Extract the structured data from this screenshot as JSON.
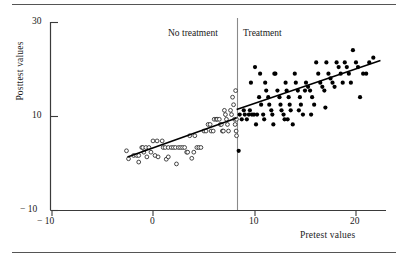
{
  "figure": {
    "kind": "scatterplot-with-regression-discontinuity",
    "rule_top": "horizontal-rule",
    "rule_bottom": "horizontal-rule"
  },
  "annotations": {
    "left_group": "No treatment",
    "right_group": "Treatment",
    "cutoff_line": "vertical-cutoff-line"
  },
  "axes": {
    "y_title": "Posttest values",
    "x_title": "Pretest values",
    "y_ticks": [
      "30",
      "10",
      "− 10"
    ],
    "x_ticks": [
      "− 10",
      "0",
      "10",
      "20"
    ]
  },
  "chart_data": {
    "type": "scatter",
    "title": "",
    "xlabel": "Pretest values",
    "ylabel": "Posttest values",
    "xlim": [
      -12,
      24
    ],
    "ylim": [
      -10,
      31
    ],
    "xticks": [
      -10,
      0,
      10,
      20
    ],
    "yticks": [
      -10,
      10,
      30
    ],
    "grid": false,
    "legend": null,
    "cutoff": {
      "x": 8.2,
      "label_left": "No treatment",
      "label_right": "Treatment"
    },
    "series": [
      {
        "name": "No treatment",
        "marker": "open-circle",
        "color": "#1a1a1a",
        "points": [
          [
            -2.6,
            2.6
          ],
          [
            -2.4,
            0.9
          ],
          [
            -1.9,
            1.6
          ],
          [
            -1.6,
            1.6
          ],
          [
            -1.4,
            1.6
          ],
          [
            -1.4,
            0.2
          ],
          [
            -1.1,
            3.3
          ],
          [
            -1.0,
            3.3
          ],
          [
            -0.7,
            3.3
          ],
          [
            -0.4,
            3.3
          ],
          [
            -0.9,
            2.3
          ],
          [
            -0.2,
            2.3
          ],
          [
            -0.6,
            1.3
          ],
          [
            0.0,
            4.7
          ],
          [
            0.2,
            1.6
          ],
          [
            0.4,
            4.7
          ],
          [
            0.5,
            1.3
          ],
          [
            0.9,
            4.7
          ],
          [
            1.0,
            3.3
          ],
          [
            1.2,
            3.3
          ],
          [
            1.3,
            0.8
          ],
          [
            1.5,
            1.3
          ],
          [
            1.5,
            3.3
          ],
          [
            1.8,
            3.3
          ],
          [
            2.0,
            3.3
          ],
          [
            2.2,
            3.3
          ],
          [
            2.3,
            -0.2
          ],
          [
            2.5,
            3.3
          ],
          [
            2.7,
            3.3
          ],
          [
            2.9,
            3.3
          ],
          [
            3.1,
            3.3
          ],
          [
            3.3,
            2.3
          ],
          [
            3.4,
            2.3
          ],
          [
            3.6,
            5.8
          ],
          [
            3.8,
            1.0
          ],
          [
            4.0,
            2.3
          ],
          [
            4.1,
            5.8
          ],
          [
            4.3,
            3.3
          ],
          [
            4.5,
            3.3
          ],
          [
            4.7,
            3.3
          ],
          [
            5.0,
            6.8
          ],
          [
            5.2,
            6.8
          ],
          [
            5.4,
            8.2
          ],
          [
            5.6,
            8.2
          ],
          [
            5.7,
            6.8
          ],
          [
            5.9,
            6.8
          ],
          [
            6.0,
            9.3
          ],
          [
            6.2,
            9.3
          ],
          [
            6.3,
            9.3
          ],
          [
            6.5,
            9.3
          ],
          [
            6.6,
            8.2
          ],
          [
            6.7,
            8.2
          ],
          [
            6.8,
            6.8
          ],
          [
            6.9,
            6.8
          ],
          [
            7.0,
            11.2
          ],
          [
            7.1,
            10.3
          ],
          [
            7.2,
            9.3
          ],
          [
            7.3,
            8.2
          ],
          [
            7.4,
            6.8
          ],
          [
            7.6,
            11.2
          ],
          [
            7.7,
            10.3
          ],
          [
            7.8,
            14.0
          ],
          [
            7.9,
            12.4
          ],
          [
            8.0,
            9.3
          ],
          [
            8.05,
            8.2
          ],
          [
            8.1,
            15.4
          ],
          [
            8.15,
            6.8
          ],
          [
            8.18,
            9.3
          ],
          [
            8.19,
            5.8
          ]
        ],
        "fit_line": {
          "x0": -2.5,
          "y0": 1.3,
          "x1": 8.2,
          "y1": 9.6
        }
      },
      {
        "name": "Treatment",
        "marker": "filled-circle",
        "color": "#000000",
        "points": [
          [
            8.4,
            2.6
          ],
          [
            8.5,
            10.3
          ],
          [
            8.7,
            9.3
          ],
          [
            8.9,
            11.2
          ],
          [
            9.0,
            10.3
          ],
          [
            9.2,
            9.3
          ],
          [
            9.4,
            10.3
          ],
          [
            9.5,
            11.2
          ],
          [
            9.7,
            10.3
          ],
          [
            9.9,
            10.3
          ],
          [
            10.0,
            20.4
          ],
          [
            10.1,
            8.2
          ],
          [
            10.2,
            10.3
          ],
          [
            10.4,
            14.0
          ],
          [
            10.6,
            12.4
          ],
          [
            10.8,
            10.3
          ],
          [
            10.9,
            9.3
          ],
          [
            11.0,
            17.1
          ],
          [
            11.1,
            15.4
          ],
          [
            11.3,
            14.0
          ],
          [
            11.4,
            12.4
          ],
          [
            11.6,
            11.2
          ],
          [
            11.7,
            10.3
          ],
          [
            11.8,
            8.2
          ],
          [
            12.0,
            19.0
          ],
          [
            12.2,
            15.4
          ],
          [
            12.4,
            14.0
          ],
          [
            12.5,
            12.4
          ],
          [
            12.6,
            11.2
          ],
          [
            12.8,
            10.3
          ],
          [
            13.0,
            17.1
          ],
          [
            13.1,
            15.4
          ],
          [
            13.3,
            14.0
          ],
          [
            13.4,
            12.4
          ],
          [
            13.5,
            11.2
          ],
          [
            13.7,
            8.2
          ],
          [
            13.9,
            19.0
          ],
          [
            14.0,
            17.1
          ],
          [
            14.2,
            15.4
          ],
          [
            14.4,
            14.0
          ],
          [
            14.5,
            12.4
          ],
          [
            14.7,
            10.3
          ],
          [
            14.9,
            15.4
          ],
          [
            15.0,
            17.1
          ],
          [
            15.2,
            16.2
          ],
          [
            15.4,
            15.4
          ],
          [
            15.6,
            14.0
          ],
          [
            15.8,
            12.4
          ],
          [
            16.0,
            21.4
          ],
          [
            16.2,
            19.0
          ],
          [
            16.4,
            17.1
          ],
          [
            16.6,
            16.2
          ],
          [
            16.8,
            15.4
          ],
          [
            17.0,
            21.4
          ],
          [
            17.2,
            19.0
          ],
          [
            17.4,
            18.0
          ],
          [
            17.6,
            17.1
          ],
          [
            17.8,
            16.2
          ],
          [
            18.0,
            21.4
          ],
          [
            18.2,
            20.4
          ],
          [
            18.4,
            19.0
          ],
          [
            18.6,
            17.1
          ],
          [
            18.8,
            21.4
          ],
          [
            19.0,
            20.4
          ],
          [
            19.2,
            19.0
          ],
          [
            19.4,
            17.1
          ],
          [
            19.6,
            24.0
          ],
          [
            19.9,
            21.4
          ],
          [
            20.1,
            20.4
          ],
          [
            20.3,
            14.0
          ],
          [
            20.6,
            19.0
          ],
          [
            20.9,
            19.0
          ],
          [
            21.2,
            21.4
          ],
          [
            21.6,
            22.4
          ],
          [
            12.9,
            9.3
          ],
          [
            14.3,
            11.2
          ],
          [
            15.5,
            10.3
          ],
          [
            16.9,
            11.8
          ],
          [
            10.5,
            19.0
          ],
          [
            11.9,
            19.0
          ],
          [
            9.6,
            17.1
          ],
          [
            13.2,
            9.3
          ]
        ],
        "fit_line": {
          "x0": 8.2,
          "y0": 11.4,
          "x1": 22.3,
          "y1": 21.8
        }
      }
    ]
  }
}
